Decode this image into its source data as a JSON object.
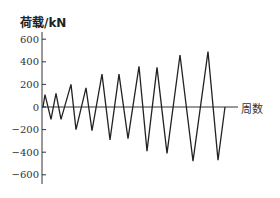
{
  "chart_data": {
    "type": "line",
    "title": "",
    "ylabel": "荷载/kN",
    "xlabel": "周数",
    "ylim": [
      -650,
      650
    ],
    "yticks": [
      600,
      400,
      200,
      0,
      -200,
      -400,
      -600
    ],
    "ytick_labels": [
      "600",
      "400",
      "200",
      "0",
      "-200",
      "-400",
      "-600"
    ],
    "grid": false,
    "legend": null,
    "series": [
      {
        "name": "loading protocol",
        "color": "#222222",
        "points": [
          [
            0,
            0
          ],
          [
            1,
            110
          ],
          [
            2,
            -110
          ],
          [
            3,
            120
          ],
          [
            4,
            -110
          ],
          [
            5,
            200
          ],
          [
            6,
            -200
          ],
          [
            7,
            170
          ],
          [
            8,
            -210
          ],
          [
            9,
            290
          ],
          [
            10,
            -290
          ],
          [
            11,
            290
          ],
          [
            12,
            -280
          ],
          [
            13,
            360
          ],
          [
            14,
            -390
          ],
          [
            15,
            350
          ],
          [
            16,
            -410
          ],
          [
            17,
            460
          ],
          [
            18,
            -480
          ],
          [
            19,
            490
          ],
          [
            20,
            -470
          ],
          [
            21,
            0
          ]
        ],
        "x_px": [
          43,
          45,
          51,
          56,
          61,
          71,
          76,
          86,
          92,
          102,
          110,
          119,
          128,
          139,
          147,
          157,
          167,
          180,
          193,
          208,
          218,
          225
        ]
      }
    ]
  }
}
